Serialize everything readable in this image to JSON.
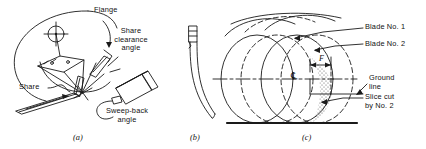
{
  "figure": {
    "background_color": "#ffffff",
    "ink_color": "#1a1a1a",
    "panels": [
      {
        "id": "a",
        "caption": "(a)",
        "description": "Rotor disc with share blade mounting detail",
        "labels": [
          {
            "name": "flange",
            "text": "Flange"
          },
          {
            "name": "share-clearance-angle",
            "lines": [
              "Share",
              "clearance",
              "angle"
            ]
          },
          {
            "name": "share",
            "text": "Share"
          },
          {
            "name": "sweep-back-angle",
            "lines": [
              "Sweep-back",
              "angle"
            ]
          }
        ]
      },
      {
        "id": "b",
        "caption": "(b)",
        "description": "Curved blade side profile",
        "labels": []
      },
      {
        "id": "c",
        "caption": "(c)",
        "description": "Overlapping blade cutting circles with ground line and slice cut",
        "labels": [
          {
            "name": "blade-no-1",
            "text": "Blade No. 1"
          },
          {
            "name": "blade-no-2",
            "text": "Blade No. 2"
          },
          {
            "name": "ground-line",
            "lines": [
              "Ground",
              "line"
            ]
          },
          {
            "name": "slice-cut-by-no-2",
            "lines": [
              "Slice cut",
              "by No. 2"
            ]
          }
        ],
        "dimension": {
          "name": "forward-travel",
          "symbol": "F"
        },
        "centerline_symbol": "℄"
      }
    ]
  }
}
